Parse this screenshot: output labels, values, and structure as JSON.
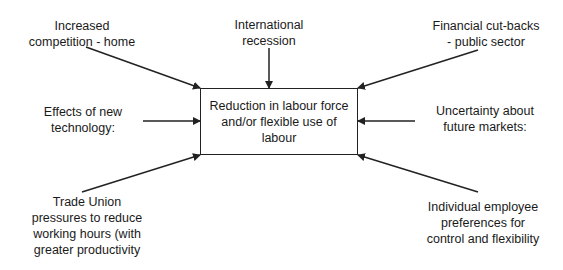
{
  "diagram": {
    "center": {
      "lines": [
        "Reduction in labour force",
        "and/or flexible use of",
        "labour"
      ]
    },
    "factors": [
      {
        "id": "competition",
        "position": "top-left",
        "lines": [
          "Increased",
          "competition - home"
        ]
      },
      {
        "id": "recession",
        "position": "top-center",
        "lines": [
          "International",
          "recession"
        ]
      },
      {
        "id": "cutbacks",
        "position": "top-right",
        "lines": [
          "Financial cut-backs",
          "- public sector"
        ]
      },
      {
        "id": "technology",
        "position": "middle-left",
        "lines": [
          "Effects of new",
          "technology:"
        ]
      },
      {
        "id": "markets",
        "position": "middle-right",
        "lines": [
          "Uncertainty about",
          "future markets:"
        ]
      },
      {
        "id": "trade-union",
        "position": "bottom-left",
        "lines": [
          "Trade Union",
          "pressures to reduce",
          "working hours (with",
          "greater productivity"
        ]
      },
      {
        "id": "employee-prefs",
        "position": "bottom-right",
        "lines": [
          "Individual employee",
          "preferences for",
          "control and flexibility"
        ]
      }
    ],
    "arrows": [
      {
        "from": "competition",
        "to": "center"
      },
      {
        "from": "recession",
        "to": "center"
      },
      {
        "from": "cutbacks",
        "to": "center"
      },
      {
        "from": "technology",
        "to": "center"
      },
      {
        "from": "markets",
        "to": "center"
      },
      {
        "from": "trade-union",
        "to": "center"
      },
      {
        "from": "employee-prefs",
        "to": "center"
      }
    ],
    "colors": {
      "line": "#222222",
      "text": "#1a1a1a",
      "background": "#ffffff"
    }
  }
}
